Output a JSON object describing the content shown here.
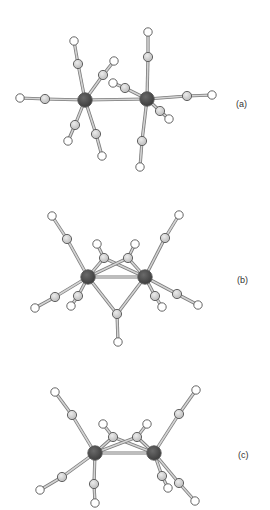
{
  "figure": {
    "colors": {
      "metal": "#3a3a3a",
      "carbon": "#cfcfcf",
      "oxygen": "#ffffff",
      "bond_outline": "#7a7a7a",
      "bond_fill": "#d4d4d4",
      "atom_outline": "#555555"
    },
    "panels": [
      {
        "id": "a",
        "label": "(a)",
        "label_pos": [
          236,
          99
        ],
        "metals": [
          [
            85,
            100
          ],
          [
            147,
            99
          ]
        ],
        "metal_bonds": [
          [
            [
              85,
              100
            ],
            [
              147,
              99
            ]
          ]
        ],
        "carbonyls": [
          {
            "m": 0,
            "c": [
              45,
              99
            ],
            "o": [
              20,
              98
            ]
          },
          {
            "m": 0,
            "c": [
              78,
              64
            ],
            "o": [
              74,
              41
            ]
          },
          {
            "m": 0,
            "c": [
              103,
              75
            ],
            "o": [
              114,
              61
            ]
          },
          {
            "m": 0,
            "c": [
              75,
              125
            ],
            "o": [
              68,
              141
            ]
          },
          {
            "m": 0,
            "c": [
              96,
              134
            ],
            "o": [
              102,
              156
            ]
          },
          {
            "m": 1,
            "c": [
              148,
              57
            ],
            "o": [
              148,
              32
            ]
          },
          {
            "m": 1,
            "c": [
              187,
              96
            ],
            "o": [
              212,
              95
            ]
          },
          {
            "m": 1,
            "c": [
              125,
              88
            ],
            "o": [
              113,
              83
            ]
          },
          {
            "m": 1,
            "c": [
              160,
              111
            ],
            "o": [
              169,
              119
            ]
          },
          {
            "m": 1,
            "c": [
              142,
              141
            ],
            "o": [
              140,
              167
            ]
          }
        ],
        "bridging": []
      },
      {
        "id": "b",
        "label": "(b)",
        "label_pos": [
          237,
          275
        ],
        "metals": [
          [
            88,
            277
          ],
          [
            145,
            277
          ]
        ],
        "metal_bonds": [
          [
            [
              88,
              277
            ],
            [
              145,
              277
            ]
          ]
        ],
        "carbonyls": [
          {
            "m": 0,
            "c": [
              67,
              239
            ],
            "o": [
              52,
              216
            ]
          },
          {
            "m": 0,
            "c": [
              55,
              297
            ],
            "o": [
              35,
              308
            ]
          },
          {
            "m": 0,
            "c": [
              78,
              296
            ],
            "o": [
              71,
              306
            ]
          },
          {
            "m": 1,
            "c": [
              165,
              238
            ],
            "o": [
              179,
              215
            ]
          },
          {
            "m": 1,
            "c": [
              177,
              294
            ],
            "o": [
              198,
              305
            ]
          },
          {
            "m": 1,
            "c": [
              155,
              296
            ],
            "o": [
              162,
              307
            ]
          }
        ],
        "bridging": [
          {
            "c": [
              104,
              258
            ],
            "o": [
              97,
              244
            ]
          },
          {
            "c": [
              128,
              258
            ],
            "o": [
              135,
              244
            ]
          },
          {
            "c": [
              117,
              314
            ],
            "o": [
              118,
              342
            ]
          }
        ]
      },
      {
        "id": "c",
        "label": "(c)",
        "label_pos": [
          238,
          450
        ],
        "metals": [
          [
            95,
            453
          ],
          [
            154,
            453
          ]
        ],
        "metal_bonds": [
          [
            [
              95,
              453
            ],
            [
              154,
              453
            ]
          ]
        ],
        "carbonyls": [
          {
            "m": 0,
            "c": [
              72,
              415
            ],
            "o": [
              55,
              392
            ]
          },
          {
            "m": 0,
            "c": [
              62,
              477
            ],
            "o": [
              40,
              490
            ]
          },
          {
            "m": 0,
            "c": [
              94,
              484
            ],
            "o": [
              95,
              503
            ]
          },
          {
            "m": 1,
            "c": [
              179,
              414
            ],
            "o": [
              196,
              390
            ]
          },
          {
            "m": 1,
            "c": [
              162,
              476
            ],
            "o": [
              168,
              488
            ]
          },
          {
            "m": 1,
            "c": [
              179,
              483
            ],
            "o": [
              195,
              501
            ]
          }
        ],
        "bridging": [
          {
            "c": [
              113,
              437
            ],
            "o": [
              103,
              424
            ]
          },
          {
            "c": [
              137,
              437
            ],
            "o": [
              147,
              424
            ]
          }
        ]
      }
    ]
  }
}
